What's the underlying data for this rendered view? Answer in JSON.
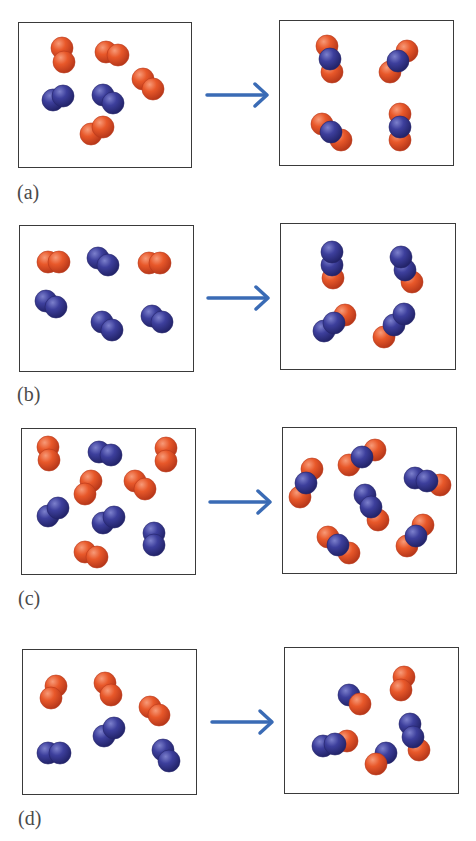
{
  "colors": {
    "oxygen": "#e8582a",
    "oxygen_dark": "#b8381a",
    "nitrogen": "#3d3f9c",
    "nitrogen_dark": "#23246a",
    "arrow": "#3a6bb5",
    "border": "#3a3a3a"
  },
  "atom_radius": 11,
  "legend_note": "orange = O atom, blue = N atom",
  "panels": [
    {
      "id": "a",
      "label": "(a)",
      "label_pos": [
        17,
        182
      ],
      "arrow": {
        "x1": 207,
        "x2": 267,
        "y": 95
      },
      "reactants_box": [
        18,
        22,
        174,
        146
      ],
      "products_box": [
        279,
        20,
        175,
        146
      ],
      "reactants": [
        {
          "type": "O2",
          "atoms": [
            [
              "O",
              62,
              48
            ],
            [
              "O",
              64,
              62
            ]
          ]
        },
        {
          "type": "O2",
          "atoms": [
            [
              "O",
              106,
              52
            ],
            [
              "O",
              118,
              55
            ]
          ]
        },
        {
          "type": "O2",
          "atoms": [
            [
              "O",
              143,
              79
            ],
            [
              "O",
              153,
              89
            ]
          ]
        },
        {
          "type": "N2",
          "atoms": [
            [
              "N",
              53,
              100
            ],
            [
              "N",
              63,
              96
            ]
          ]
        },
        {
          "type": "N2",
          "atoms": [
            [
              "N",
              103,
              95
            ],
            [
              "N",
              113,
              103
            ]
          ]
        },
        {
          "type": "O2",
          "atoms": [
            [
              "O",
              91,
              134
            ],
            [
              "O",
              103,
              127
            ]
          ]
        }
      ],
      "products": [
        {
          "type": "ONO",
          "atoms": [
            [
              "O",
              327,
              46
            ],
            [
              "O",
              332,
              72
            ],
            [
              "N",
              330,
              59
            ]
          ]
        },
        {
          "type": "ONO",
          "atoms": [
            [
              "O",
              407,
              51
            ],
            [
              "O",
              390,
              72
            ],
            [
              "N",
              398,
              61
            ]
          ]
        },
        {
          "type": "ONO",
          "atoms": [
            [
              "O",
              322,
              124
            ],
            [
              "O",
              341,
              140
            ],
            [
              "N",
              331,
              132
            ]
          ]
        },
        {
          "type": "ONO",
          "atoms": [
            [
              "O",
              400,
              114
            ],
            [
              "O",
              400,
              140
            ],
            [
              "N",
              400,
              127
            ]
          ]
        }
      ]
    },
    {
      "id": "b",
      "label": "(b)",
      "label_pos": [
        17,
        384
      ],
      "arrow": {
        "x1": 208,
        "x2": 268,
        "y": 298
      },
      "reactants_box": [
        19,
        225,
        175,
        147
      ],
      "products_box": [
        280,
        223,
        176,
        147
      ],
      "reactants": [
        {
          "type": "O2",
          "atoms": [
            [
              "O",
              48,
              262
            ],
            [
              "O",
              59,
              262
            ]
          ]
        },
        {
          "type": "N2",
          "atoms": [
            [
              "N",
              98,
              258
            ],
            [
              "N",
              108,
              265
            ]
          ]
        },
        {
          "type": "O2",
          "atoms": [
            [
              "O",
              149,
              263
            ],
            [
              "O",
              160,
              263
            ]
          ]
        },
        {
          "type": "N2",
          "atoms": [
            [
              "N",
              46,
              301
            ],
            [
              "N",
              56,
              307
            ]
          ]
        },
        {
          "type": "N2",
          "atoms": [
            [
              "N",
              102,
              322
            ],
            [
              "N",
              112,
              330
            ]
          ]
        },
        {
          "type": "N2",
          "atoms": [
            [
              "N",
              152,
              316
            ],
            [
              "N",
              162,
              322
            ]
          ]
        }
      ],
      "products": [
        {
          "type": "NNO",
          "atoms": [
            [
              "O",
              333,
              278
            ],
            [
              "N",
              332,
              265
            ],
            [
              "N",
              332,
              252
            ]
          ]
        },
        {
          "type": "NNO",
          "atoms": [
            [
              "O",
              412,
              282
            ],
            [
              "N",
              405,
              270
            ],
            [
              "N",
              401,
              257
            ]
          ]
        },
        {
          "type": "NNO",
          "atoms": [
            [
              "O",
              345,
              315
            ],
            [
              "N",
              324,
              331
            ],
            [
              "N",
              334,
              323
            ]
          ]
        },
        {
          "type": "NNO",
          "atoms": [
            [
              "O",
              384,
              337
            ],
            [
              "N",
              394,
              325
            ],
            [
              "N",
              404,
              314
            ]
          ]
        }
      ]
    },
    {
      "id": "c",
      "label": "(c)",
      "label_pos": [
        18,
        588
      ],
      "arrow": {
        "x1": 210,
        "x2": 270,
        "y": 502
      },
      "reactants_box": [
        21,
        428,
        175,
        147
      ],
      "products_box": [
        282,
        427,
        175,
        147
      ],
      "reactants": [
        {
          "type": "O2",
          "atoms": [
            [
              "O",
              48,
              447
            ],
            [
              "O",
              49,
              460
            ]
          ]
        },
        {
          "type": "N2",
          "atoms": [
            [
              "N",
              99,
              452
            ],
            [
              "N",
              111,
              455
            ]
          ]
        },
        {
          "type": "O2",
          "atoms": [
            [
              "O",
              166,
              448
            ],
            [
              "O",
              166,
              461
            ]
          ]
        },
        {
          "type": "O2",
          "atoms": [
            [
              "O",
              91,
              481
            ],
            [
              "O",
              85,
              494
            ]
          ]
        },
        {
          "type": "O2",
          "atoms": [
            [
              "O",
              135,
              481
            ],
            [
              "O",
              145,
              489
            ]
          ]
        },
        {
          "type": "N2",
          "atoms": [
            [
              "N",
              48,
              516
            ],
            [
              "N",
              58,
              508
            ]
          ]
        },
        {
          "type": "N2",
          "atoms": [
            [
              "N",
              103,
              523
            ],
            [
              "N",
              114,
              517
            ]
          ]
        },
        {
          "type": "N2",
          "atoms": [
            [
              "N",
              154,
              533
            ],
            [
              "N",
              154,
              545
            ]
          ]
        },
        {
          "type": "O2",
          "atoms": [
            [
              "O",
              85,
              552
            ],
            [
              "O",
              97,
              557
            ]
          ]
        }
      ],
      "products": [
        {
          "type": "ONO",
          "atoms": [
            [
              "O",
              312,
              469
            ],
            [
              "O",
              300,
              497
            ],
            [
              "N",
              306,
              483
            ]
          ]
        },
        {
          "type": "ONO",
          "atoms": [
            [
              "O",
              349,
              465
            ],
            [
              "O",
              375,
              450
            ],
            [
              "N",
              362,
              457
            ]
          ]
        },
        {
          "type": "NNO",
          "atoms": [
            [
              "O",
              440,
              485
            ],
            [
              "N",
              415,
              478
            ],
            [
              "N",
              427,
              481
            ]
          ]
        },
        {
          "type": "NNO",
          "atoms": [
            [
              "O",
              378,
              520
            ],
            [
              "N",
              365,
              495
            ],
            [
              "N",
              371,
              507
            ]
          ]
        },
        {
          "type": "ONO",
          "atoms": [
            [
              "O",
              328,
              537
            ],
            [
              "O",
              349,
              553
            ],
            [
              "N",
              338,
              545
            ]
          ]
        },
        {
          "type": "ONO",
          "atoms": [
            [
              "O",
              423,
              525
            ],
            [
              "O",
              407,
              546
            ],
            [
              "N",
              416,
              536
            ]
          ]
        }
      ]
    },
    {
      "id": "d",
      "label": "(d)",
      "label_pos": [
        18,
        808
      ],
      "arrow": {
        "x1": 212,
        "x2": 272,
        "y": 722
      },
      "reactants_box": [
        22,
        649,
        175,
        146
      ],
      "products_box": [
        284,
        647,
        175,
        147
      ],
      "reactants": [
        {
          "type": "O2",
          "atoms": [
            [
              "O",
              56,
              686
            ],
            [
              "O",
              51,
              698
            ]
          ]
        },
        {
          "type": "O2",
          "atoms": [
            [
              "O",
              105,
              683
            ],
            [
              "O",
              111,
              695
            ]
          ]
        },
        {
          "type": "O2",
          "atoms": [
            [
              "O",
              150,
              707
            ],
            [
              "O",
              159,
              715
            ]
          ]
        },
        {
          "type": "N2",
          "atoms": [
            [
              "N",
              104,
              736
            ],
            [
              "N",
              114,
              728
            ]
          ]
        },
        {
          "type": "N2",
          "atoms": [
            [
              "N",
              48,
              753
            ],
            [
              "N",
              60,
              753
            ]
          ]
        },
        {
          "type": "N2",
          "atoms": [
            [
              "N",
              163,
              750
            ],
            [
              "N",
              169,
              761
            ]
          ]
        }
      ],
      "products": [
        {
          "type": "NO",
          "atoms": [
            [
              "N",
              349,
              695
            ],
            [
              "O",
              360,
              704
            ]
          ]
        },
        {
          "type": "O2",
          "atoms": [
            [
              "O",
              404,
              677
            ],
            [
              "O",
              401,
              690
            ]
          ]
        },
        {
          "type": "NNO",
          "atoms": [
            [
              "O",
              347,
              741
            ],
            [
              "N",
              323,
              746
            ],
            [
              "N",
              335,
              744
            ]
          ]
        },
        {
          "type": "NO",
          "atoms": [
            [
              "N",
              386,
              753
            ],
            [
              "O",
              376,
              764
            ]
          ]
        },
        {
          "type": "NNO",
          "atoms": [
            [
              "O",
              419,
              750
            ],
            [
              "N",
              410,
              724
            ],
            [
              "N",
              413,
              737
            ]
          ]
        }
      ]
    }
  ]
}
